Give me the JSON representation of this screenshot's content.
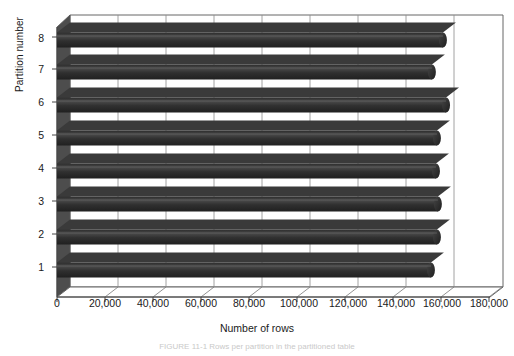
{
  "chart_data": {
    "type": "bar",
    "orientation": "horizontal",
    "title": "",
    "xlabel": "Number of rows",
    "ylabel": "Partition number",
    "categories": [
      "1",
      "2",
      "3",
      "4",
      "5",
      "6",
      "7",
      "8"
    ],
    "values": [
      155800,
      158300,
      158700,
      157900,
      158300,
      162100,
      156200,
      160800
    ],
    "series": [
      {
        "name": "Number of rows",
        "values": [
          155800,
          158300,
          158700,
          157900,
          158300,
          162100,
          156200,
          160800
        ]
      }
    ],
    "xlim": [
      0,
      180000
    ],
    "ylim": [
      0,
      9
    ],
    "xticks": [
      0,
      20000,
      40000,
      60000,
      80000,
      100000,
      120000,
      140000,
      160000,
      180000
    ],
    "xticklabels": [
      "0",
      "20,000",
      "40,000",
      "60,000",
      "80,000",
      "100,000",
      "120,000",
      "140,000",
      "160,000",
      "180,000"
    ],
    "yticklabels": [
      "1",
      "2",
      "3",
      "4",
      "5",
      "6",
      "7",
      "8"
    ],
    "grid": "vertical",
    "legend": "none",
    "style_3d": true,
    "bar_color": "#333333",
    "bar_shape": "cylinder",
    "plot_background": "#ffffff",
    "wall_color": "#4a4a4a",
    "gridline_color": "#888888",
    "axis_color": "#555555"
  },
  "axes": {
    "x_title": "Number of rows",
    "y_title": "Partition number"
  },
  "caption": {
    "text": "FIGURE 11-1   Rows per partition in the partitioned table"
  }
}
